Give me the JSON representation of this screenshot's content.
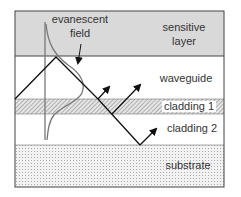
{
  "diagram": {
    "layers": [
      {
        "id": "sensitive",
        "label_lines": [
          "sensitive",
          "layer"
        ],
        "color": "#d9d9d9"
      },
      {
        "id": "waveguide",
        "label_lines": [
          "waveguide"
        ],
        "color": "#ffffff"
      },
      {
        "id": "cladding1",
        "label_lines": [
          "cladding 1"
        ],
        "color": "#c8c8c8"
      },
      {
        "id": "cladding2",
        "label_lines": [
          "cladding 2"
        ],
        "color": "#ffffff"
      },
      {
        "id": "substrate",
        "label_lines": [
          "substrate"
        ],
        "color": "#ececec"
      }
    ],
    "field_label": [
      "evanescent",
      "field"
    ],
    "ray_color": "#111111",
    "field_curve_color": "#777777"
  }
}
